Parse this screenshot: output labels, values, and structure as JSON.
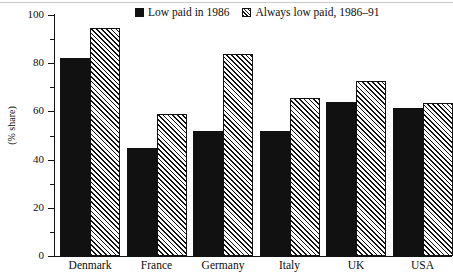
{
  "chart_data": {
    "type": "bar",
    "title": "",
    "xlabel": "",
    "ylabel": "(% share)",
    "ylim": [
      0,
      100
    ],
    "ytick_step": 20,
    "yminor_step": 10,
    "grid": false,
    "legend_position": "top-center",
    "categories": [
      "Denmark",
      "France",
      "Germany",
      "Italy",
      "UK",
      "USA"
    ],
    "ytick_labels": [
      "0",
      "20",
      "40",
      "60",
      "80",
      "100"
    ],
    "ytick_values": [
      0,
      20,
      40,
      60,
      80,
      100
    ],
    "yminor_values": [
      10,
      30,
      50,
      70,
      90
    ],
    "series": [
      {
        "name": "Low paid in 1986",
        "style": "solid-black",
        "color": "#111111",
        "values": [
          82,
          45,
          52,
          52,
          64,
          61.5
        ]
      },
      {
        "name": "Always low paid, 1986–91",
        "style": "diagonal-hatch",
        "color": "#111111",
        "values": [
          94.5,
          59,
          84,
          65.5,
          72.5,
          63.5
        ]
      }
    ]
  },
  "legend": {
    "entries": [
      {
        "label": "Low paid in 1986",
        "swatch": "solid-swatch"
      },
      {
        "label": "Always low paid, 1986–91",
        "swatch": "hatch-swatch"
      }
    ]
  },
  "axis": {
    "y_title": "(% share)"
  }
}
